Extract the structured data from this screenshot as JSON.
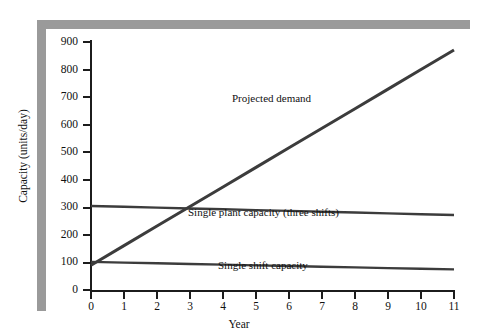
{
  "chart_data": {
    "type": "line",
    "title": "",
    "xlabel": "Year",
    "ylabel": "Capacity (units/day)",
    "xlim": [
      0,
      11
    ],
    "ylim": [
      0,
      900
    ],
    "xticks": [
      0,
      1,
      2,
      3,
      4,
      5,
      6,
      7,
      8,
      9,
      10,
      11
    ],
    "yticks": [
      0,
      100,
      200,
      300,
      400,
      500,
      600,
      700,
      800,
      900
    ],
    "grid": false,
    "legend_position": "inline-annotations",
    "x": [
      0,
      1,
      2,
      3,
      4,
      5,
      6,
      7,
      8,
      9,
      10,
      11
    ],
    "series": [
      {
        "name": "Projected demand",
        "color": "#3c3c3c",
        "values": [
          90,
          161,
          232,
          303,
          374,
          445,
          516,
          587,
          658,
          729,
          800,
          871
        ]
      },
      {
        "name": "Single plant capacity (three shifts)",
        "color": "#3c3c3c",
        "values": [
          305,
          302,
          299,
          296,
          293,
          290,
          287,
          284,
          281,
          278,
          275,
          272
        ]
      },
      {
        "name": "Single shift capacity",
        "color": "#3c3c3c",
        "values": [
          102,
          99.5,
          97,
          94.5,
          92,
          89.5,
          87,
          84.5,
          82,
          79.5,
          77,
          75
        ]
      }
    ],
    "annotations": [
      {
        "text": "Projected demand",
        "x": 6.2,
        "y": 660
      },
      {
        "text": "Single plant capacity (three shifts)",
        "x": 4.8,
        "y": 245
      },
      {
        "text": "Single shift capacity",
        "x": 5.9,
        "y": 55
      }
    ],
    "colors": {
      "line": "#3c3c3c",
      "axis": "#1c1c1c",
      "frame": "#9a9a9a",
      "background": "#ffffff"
    }
  }
}
